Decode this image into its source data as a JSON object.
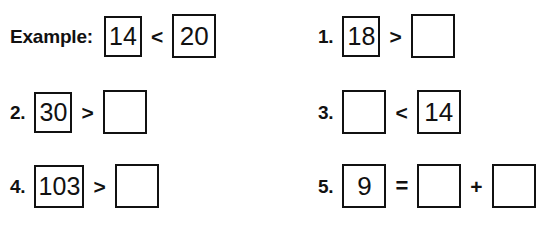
{
  "page": {
    "type": "math-worksheet",
    "topic": "comparing-numbers",
    "background_color": "#ffffff",
    "ink_color": "#111111"
  },
  "problems": [
    {
      "id": "example",
      "label": "Example:",
      "column": "left",
      "row": 1,
      "terms": [
        {
          "kind": "number",
          "value": "14",
          "filled": true
        },
        {
          "kind": "operator",
          "value": "<"
        },
        {
          "kind": "number",
          "value": "20",
          "filled": true
        }
      ]
    },
    {
      "id": "q1",
      "label": "1.",
      "column": "right",
      "row": 1,
      "terms": [
        {
          "kind": "number",
          "value": "18",
          "filled": true
        },
        {
          "kind": "operator",
          "value": ">"
        },
        {
          "kind": "number",
          "value": "",
          "filled": false
        }
      ]
    },
    {
      "id": "q2",
      "label": "2.",
      "column": "left",
      "row": 2,
      "terms": [
        {
          "kind": "number",
          "value": "30",
          "filled": true
        },
        {
          "kind": "operator",
          "value": ">"
        },
        {
          "kind": "number",
          "value": "",
          "filled": false
        }
      ]
    },
    {
      "id": "q3",
      "label": "3.",
      "column": "right",
      "row": 2,
      "terms": [
        {
          "kind": "number",
          "value": "",
          "filled": false
        },
        {
          "kind": "operator",
          "value": "<"
        },
        {
          "kind": "number",
          "value": "14",
          "filled": true
        }
      ]
    },
    {
      "id": "q4",
      "label": "4.",
      "column": "left",
      "row": 3,
      "terms": [
        {
          "kind": "number",
          "value": "103",
          "filled": true
        },
        {
          "kind": "operator",
          "value": ">"
        },
        {
          "kind": "number",
          "value": "",
          "filled": false
        }
      ]
    },
    {
      "id": "q5",
      "label": "5.",
      "column": "right",
      "row": 3,
      "terms": [
        {
          "kind": "number",
          "value": "9",
          "filled": true
        },
        {
          "kind": "operator",
          "value": "="
        },
        {
          "kind": "number",
          "value": "",
          "filled": false
        },
        {
          "kind": "operator",
          "value": "+"
        },
        {
          "kind": "number",
          "value": "",
          "filled": false
        }
      ]
    }
  ]
}
